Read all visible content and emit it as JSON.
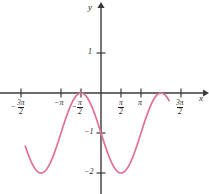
{
  "chart_data": {
    "type": "line",
    "title": "",
    "xlabel": "x",
    "ylabel": "y",
    "function": "y = -1 - sin(x)",
    "xlim": [
      -5.95,
      5.35
    ],
    "ylim": [
      -2.55,
      1.45
    ],
    "grid": false,
    "legend": null,
    "curve_color": "#e0708f",
    "axis_color": "#3a3a3a",
    "x_ticks": [
      {
        "value": -4.71238898038469,
        "label": "-3π/2"
      },
      {
        "value": -3.141592653589793,
        "label": "-π"
      },
      {
        "value": -1.570796326794897,
        "label": "-π/2"
      },
      {
        "value": 1.570796326794897,
        "label": "π/2"
      },
      {
        "value": 3.141592653589793,
        "label": "π"
      },
      {
        "value": 4.71238898038469,
        "label": "3π/2"
      }
    ],
    "y_ticks": [
      {
        "value": 1,
        "label": "1"
      },
      {
        "value": -1,
        "label": "-1"
      },
      {
        "value": -2,
        "label": "-2"
      }
    ],
    "points": [
      {
        "x": -4.71238898038469,
        "y": 0
      },
      {
        "x": -3.926990816987241,
        "y": -0.2928932188
      },
      {
        "x": -3.141592653589793,
        "y": -1
      },
      {
        "x": -2.356194490192345,
        "y": -1.7071067812
      },
      {
        "x": -1.570796326794897,
        "y": -2
      },
      {
        "x": -0.785398163397448,
        "y": -1.7071067812
      },
      {
        "x": 0,
        "y": -1
      },
      {
        "x": 0.785398163397448,
        "y": -0.2928932188
      },
      {
        "x": 1.570796326794897,
        "y": 0
      },
      {
        "x": 2.356194490192345,
        "y": -0.2928932188
      },
      {
        "x": 3.141592653589793,
        "y": -1
      },
      {
        "x": 3.926990816987241,
        "y": -1.7071067812
      },
      {
        "x": 4.71238898038469,
        "y": -2
      }
    ],
    "extrema": [
      {
        "x": -4.71238898038469,
        "y": 0,
        "kind": "maximum"
      },
      {
        "x": -1.570796326794897,
        "y": -2,
        "kind": "minimum"
      },
      {
        "x": 1.570796326794897,
        "y": 0,
        "kind": "maximum"
      },
      {
        "x": 4.71238898038469,
        "y": -2,
        "kind": "minimum"
      }
    ]
  },
  "labels": {
    "y_axis_name": "y",
    "x_axis_name": "x",
    "y_tick_1": "1",
    "y_tick_neg1": "−1",
    "y_tick_neg2": "−2",
    "x_tick_neg_3pi_2": {
      "sign": "−",
      "num": "3π",
      "den": "2"
    },
    "x_tick_neg_pi": "−π",
    "x_tick_neg_pi_2": {
      "sign": "−",
      "num": "π",
      "den": "2"
    },
    "x_tick_pi_2": {
      "sign": "",
      "num": "π",
      "den": "2"
    },
    "x_tick_pi": "π",
    "x_tick_3pi_2": {
      "sign": "",
      "num": "3π",
      "den": "2"
    }
  }
}
